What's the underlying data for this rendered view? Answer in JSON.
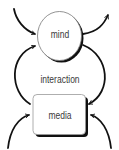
{
  "diagram": {
    "nodes": {
      "mind": {
        "label": "mind",
        "shape": "ellipse"
      },
      "media": {
        "label": "media",
        "shape": "rounded-rectangle"
      }
    },
    "center_label": "interaction",
    "edges": [
      {
        "from": "outside-top-left",
        "to": "mind",
        "direction": "in"
      },
      {
        "from": "media",
        "to": "mind",
        "direction": "left-loop"
      },
      {
        "from": "mind",
        "to": "outside-top-right",
        "direction": "out"
      },
      {
        "from": "mind",
        "to": "media",
        "direction": "right-loop"
      },
      {
        "from": "outside-bottom-left",
        "to": "media",
        "direction": "in"
      },
      {
        "from": "outside-bottom-right",
        "to": "media",
        "direction": "in"
      }
    ],
    "colors": {
      "stroke": "#111111",
      "text": "#3a3a3a",
      "background": "#ffffff"
    }
  }
}
